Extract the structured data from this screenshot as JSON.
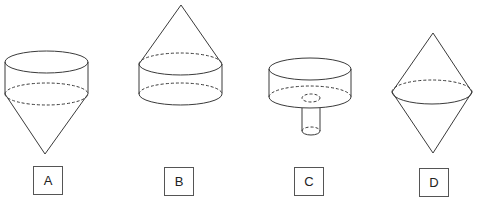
{
  "figure": {
    "options": [
      {
        "id": "A",
        "label": "A",
        "description": "cylinder on top of an inverted cone (cone pointing down)"
      },
      {
        "id": "B",
        "label": "B",
        "description": "cone on top of a cylinder (cone pointing up)"
      },
      {
        "id": "C",
        "label": "C",
        "description": "wide short cylinder with a narrow cylindrical tube attached below its center"
      },
      {
        "id": "D",
        "label": "D",
        "description": "two cones joined at their bases (double cone)"
      }
    ]
  }
}
